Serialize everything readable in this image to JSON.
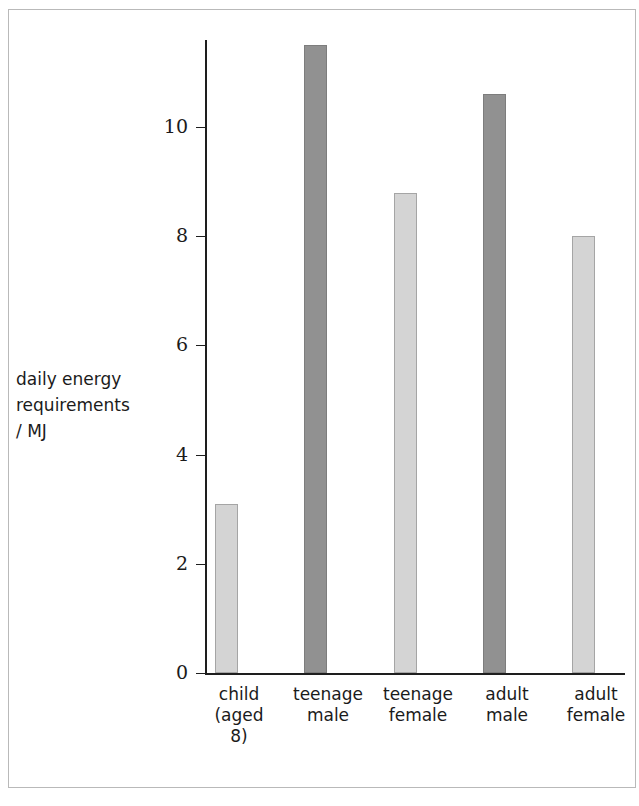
{
  "chart_data": {
    "type": "bar",
    "title": "",
    "xlabel": "",
    "ylabel": "daily energy requirements / MJ",
    "ylabel_lines": [
      "daily energy",
      "requirements",
      "/ MJ"
    ],
    "categories": [
      "child (aged 8)",
      "teenage male",
      "teenage female",
      "adult male",
      "adult female"
    ],
    "category_lines": [
      [
        "child",
        "(aged",
        "8)"
      ],
      [
        "teenage",
        "male"
      ],
      [
        "teenage",
        "female"
      ],
      [
        "adult",
        "male"
      ],
      [
        "adult",
        "female"
      ]
    ],
    "values": [
      3.1,
      11.5,
      8.8,
      10.6,
      8.0
    ],
    "units": "MJ",
    "ylim": [
      0,
      11.6
    ],
    "yticks": [
      0,
      2,
      4,
      6,
      8,
      10
    ],
    "ytick_labels": [
      "0",
      "2",
      "4",
      "6",
      "8",
      "10"
    ],
    "grid": false,
    "legend": "none",
    "bar_colors": [
      "light",
      "dark",
      "light",
      "dark",
      "light"
    ],
    "colors": {
      "light_bar": "#d4d4d4",
      "light_bar_border": "#a5a5a5",
      "dark_bar": "#919191",
      "dark_bar_border": "#7d7d7d",
      "axis": "#1e1e1e",
      "text": "#1b1b1b",
      "frame": "#b9b9b9",
      "background": "#ffffff"
    }
  },
  "geometry": {
    "baseline_y": 673,
    "px_per_unit": 54.6,
    "axis_left_x": 205,
    "bar_width": 23,
    "bar_x": [
      215,
      304,
      394,
      483,
      572
    ],
    "label_x": [
      196,
      285,
      375,
      464,
      553
    ],
    "label_top": 684,
    "tick_y": [
      673,
      564,
      455,
      345,
      236,
      127
    ]
  }
}
